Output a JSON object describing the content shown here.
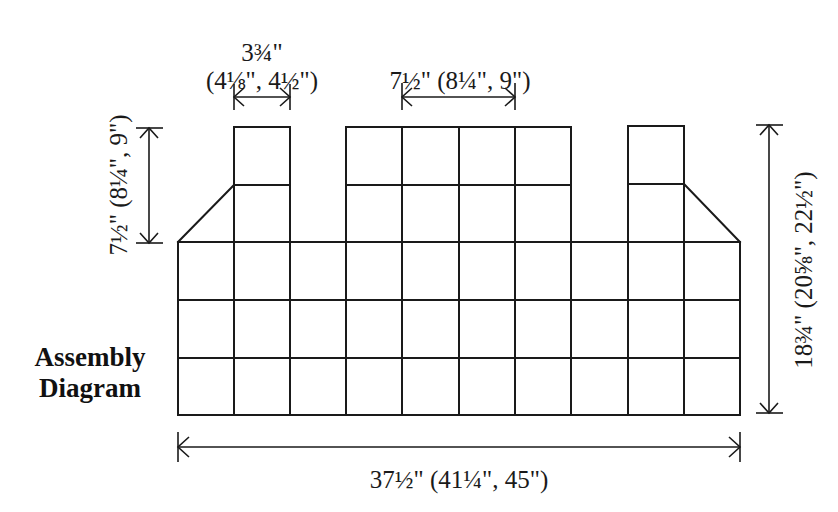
{
  "title": {
    "line1": "Assembly",
    "line2": "Diagram"
  },
  "dimensions": {
    "column_width": {
      "label_line1": "3¾\"",
      "label_line2": "(4⅛\", 4½\")"
    },
    "center_width": {
      "label": "7½\" (8¼\", 9\")"
    },
    "column_height": {
      "label": "7½\" (8¼\", 9\")"
    },
    "total_height": {
      "label": "18¾\" (20⅝\", 22½\")"
    },
    "total_width": {
      "label": "37½\" (41¼\", 45\")"
    }
  },
  "grid": {
    "body_columns": 10,
    "body_rows": 3,
    "top_blocks": [
      {
        "name": "left-column",
        "columns": 1,
        "rows": 2
      },
      {
        "name": "center-block",
        "columns": 4,
        "rows": 2
      },
      {
        "name": "right-column",
        "columns": 1,
        "rows": 2
      }
    ],
    "line_color": "#1a1a1a"
  }
}
